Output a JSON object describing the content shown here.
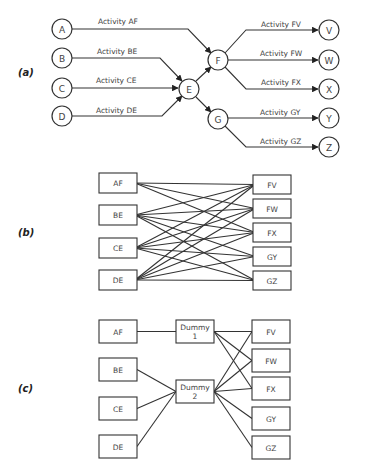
{
  "panels": {
    "a": {
      "label": "(a)",
      "nodes": {
        "A": "A",
        "B": "B",
        "C": "C",
        "D": "D",
        "E": "E",
        "F": "F",
        "G": "G",
        "V": "V",
        "W": "W",
        "X": "X",
        "Y": "Y",
        "Z": "Z"
      },
      "activities": {
        "AF": "Activity AF",
        "BE": "Activity BE",
        "CE": "Activity CE",
        "DE": "Activity DE",
        "FV": "Activity FV",
        "FW": "Activity FW",
        "FX": "Activity FX",
        "GY": "Activity GY",
        "GZ": "Activity GZ"
      }
    },
    "b": {
      "label": "(b)",
      "left": [
        "AF",
        "BE",
        "CE",
        "DE"
      ],
      "right": [
        "FV",
        "FW",
        "FX",
        "GY",
        "GZ"
      ],
      "edges": [
        [
          "AF",
          "FV"
        ],
        [
          "AF",
          "FW"
        ],
        [
          "AF",
          "FX"
        ],
        [
          "BE",
          "FV"
        ],
        [
          "BE",
          "FW"
        ],
        [
          "BE",
          "FX"
        ],
        [
          "BE",
          "GY"
        ],
        [
          "BE",
          "GZ"
        ],
        [
          "CE",
          "FV"
        ],
        [
          "CE",
          "FW"
        ],
        [
          "CE",
          "FX"
        ],
        [
          "CE",
          "GY"
        ],
        [
          "CE",
          "GZ"
        ],
        [
          "DE",
          "FV"
        ],
        [
          "DE",
          "FW"
        ],
        [
          "DE",
          "FX"
        ],
        [
          "DE",
          "GY"
        ],
        [
          "DE",
          "GZ"
        ]
      ]
    },
    "c": {
      "label": "(c)",
      "left": [
        "AF",
        "BE",
        "CE",
        "DE"
      ],
      "dummies": [
        {
          "line1": "Dummy",
          "line2": "1"
        },
        {
          "line1": "Dummy",
          "line2": "2"
        }
      ],
      "right": [
        "FV",
        "FW",
        "FX",
        "GY",
        "GZ"
      ],
      "edges_in": [
        [
          "AF",
          "D1"
        ],
        [
          "BE",
          "D2"
        ],
        [
          "CE",
          "D2"
        ],
        [
          "DE",
          "D2"
        ]
      ],
      "edges_out": [
        [
          "D1",
          "FV"
        ],
        [
          "D1",
          "FW"
        ],
        [
          "D1",
          "FX"
        ],
        [
          "D2",
          "FV"
        ],
        [
          "D2",
          "FW"
        ],
        [
          "D2",
          "FX"
        ],
        [
          "D2",
          "GY"
        ],
        [
          "D2",
          "GZ"
        ]
      ]
    }
  }
}
